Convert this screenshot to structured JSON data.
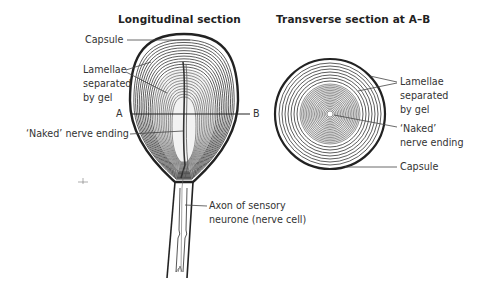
{
  "titles": {
    "longitudinal": "Longitudinal section",
    "transverse": "Transverse section at A–B"
  },
  "longitudinal_labels": {
    "capsule": "Capsule",
    "lamellae": [
      "Lamellae",
      "separated",
      "by gel"
    ],
    "point_a": "A",
    "point_b": "B",
    "naked_ending": "‘Naked’ nerve ending",
    "axon": [
      "Axon of sensory",
      "neurone (nerve cell)"
    ]
  },
  "transverse_labels": {
    "lamellae": [
      "Lamellae",
      "separated",
      "by gel"
    ],
    "naked_ending": [
      "‘Naked’",
      "nerve ending"
    ],
    "capsule": "Capsule"
  },
  "colors": {
    "ink": "#2a2a2a",
    "line": "#444444"
  }
}
